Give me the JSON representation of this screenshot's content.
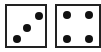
{
  "dice": [
    {
      "value": 3,
      "label": "3"
    },
    {
      "value": 4,
      "label": "4"
    }
  ],
  "colors": {
    "border": "#222222",
    "pip": "#111111",
    "face": "#ffffff"
  }
}
